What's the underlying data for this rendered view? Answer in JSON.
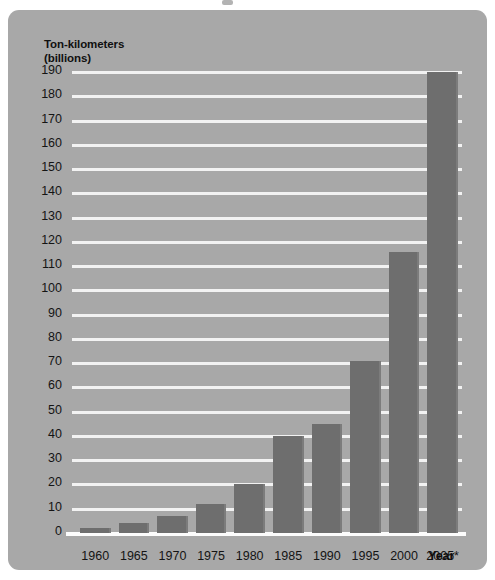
{
  "chart_data": {
    "type": "bar",
    "title": "",
    "ylabel_line1": "Ton-kilometers",
    "ylabel_line2": "(billions)",
    "xlabel": "Year",
    "footnote": "*Forecast",
    "categories": [
      "1960",
      "1965",
      "1970",
      "1975",
      "1980",
      "1985",
      "1990",
      "1995",
      "2000",
      "2005*"
    ],
    "values": [
      2,
      4,
      7,
      12,
      20,
      40,
      45,
      71,
      116,
      190
    ],
    "ylim": [
      0,
      195
    ],
    "yticks": [
      190,
      180,
      170,
      160,
      150,
      140,
      130,
      120,
      110,
      100,
      90,
      80,
      70,
      60,
      50,
      40,
      30,
      20,
      10,
      0
    ],
    "grid": true,
    "legend": "none",
    "colors": {
      "panel_background": "#a8a8a8",
      "bar": "#6e6e6e",
      "gridline": "#f2f2f2",
      "axis": "#fcfcfc",
      "text": "#141414"
    }
  }
}
